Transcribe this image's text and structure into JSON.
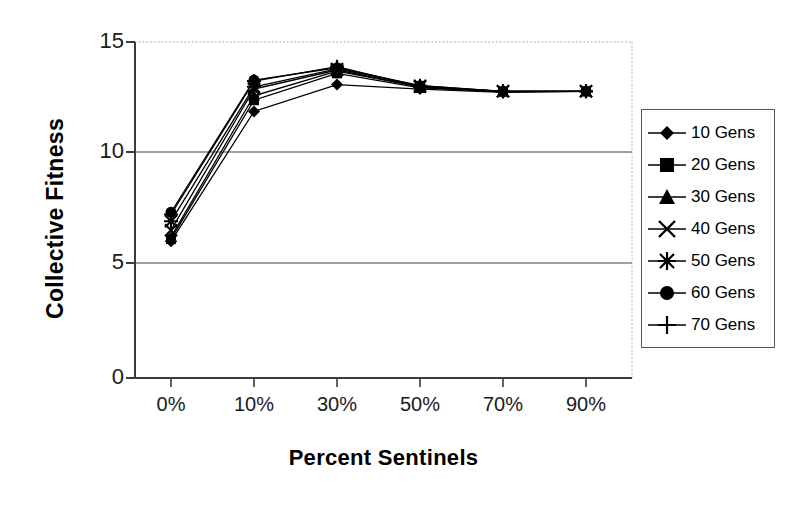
{
  "chart_data": {
    "type": "line",
    "title": "",
    "xlabel": "Percent Sentinels",
    "ylabel": "Collective Fitness",
    "categories": [
      "0%",
      "10%",
      "30%",
      "50%",
      "70%",
      "90%"
    ],
    "ylim": [
      0,
      15
    ],
    "yticks": [
      0,
      5,
      10,
      15
    ],
    "grid": true,
    "legend_position": "right",
    "series": [
      {
        "name": "10 Gens",
        "marker": "diamond",
        "values": [
          6.1,
          11.9,
          13.1,
          12.9,
          12.75,
          12.8
        ]
      },
      {
        "name": "20 Gens",
        "marker": "square",
        "values": [
          6.2,
          12.4,
          13.6,
          12.95,
          12.78,
          12.8
        ]
      },
      {
        "name": "30 Gens",
        "marker": "triangle",
        "values": [
          6.3,
          12.6,
          13.7,
          13.0,
          12.8,
          12.8
        ]
      },
      {
        "name": "40 Gens",
        "marker": "cross",
        "values": [
          6.6,
          12.9,
          13.75,
          13.0,
          12.8,
          12.8
        ]
      },
      {
        "name": "50 Gens",
        "marker": "star",
        "values": [
          7.0,
          13.0,
          13.8,
          13.05,
          12.8,
          12.8
        ]
      },
      {
        "name": "60 Gens",
        "marker": "circle",
        "values": [
          7.4,
          13.3,
          13.85,
          13.05,
          12.8,
          12.8
        ]
      },
      {
        "name": "70 Gens",
        "marker": "plus",
        "values": [
          7.3,
          13.25,
          13.9,
          13.0,
          12.8,
          12.8
        ]
      }
    ]
  },
  "axis": {
    "y_title": "Collective Fitness",
    "x_title": "Percent Sentinels",
    "y_tick_labels": [
      "15",
      "10",
      "5",
      "0"
    ],
    "x_tick_labels": [
      "0%",
      "10%",
      "30%",
      "50%",
      "70%",
      "90%"
    ]
  },
  "legend": {
    "items": [
      {
        "label": "10 Gens",
        "marker": "diamond-marker"
      },
      {
        "label": "20 Gens",
        "marker": "square-marker"
      },
      {
        "label": "30 Gens",
        "marker": "triangle-marker"
      },
      {
        "label": "40 Gens",
        "marker": "cross-marker"
      },
      {
        "label": "50 Gens",
        "marker": "star-marker"
      },
      {
        "label": "60 Gens",
        "marker": "circle-marker"
      },
      {
        "label": "70 Gens",
        "marker": "plus-marker"
      }
    ]
  },
  "colors": {
    "series": "#000000",
    "gridline": "#7f7f7f",
    "axis": "#444444",
    "plot_border": "#bdbdbd",
    "background": "#ffffff"
  }
}
